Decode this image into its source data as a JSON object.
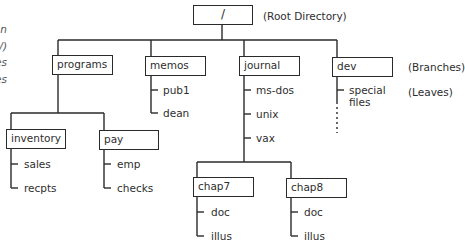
{
  "diagram": {
    "left_caption_fragments": [
      "n",
      "/)",
      "es",
      "es"
    ],
    "annotations": {
      "root": "(Root Directory)",
      "branches": "(Branches)",
      "leaves": "(Leaves)"
    },
    "root": {
      "label": "/"
    },
    "branches": [
      {
        "label": "programs",
        "children": [
          {
            "label": "inventory",
            "leaves": [
              "sales",
              "recpts"
            ]
          },
          {
            "label": "pay",
            "leaves": [
              "emp",
              "checks"
            ]
          }
        ]
      },
      {
        "label": "memos",
        "leaves": [
          "pub1",
          "dean"
        ]
      },
      {
        "label": "journal",
        "leaves": [
          "ms-dos",
          "unix",
          "vax"
        ],
        "children": [
          {
            "label": "chap7",
            "leaves": [
              "doc",
              "illus"
            ]
          },
          {
            "label": "chap8",
            "leaves": [
              "doc",
              "illus"
            ]
          }
        ]
      },
      {
        "label": "dev",
        "leaves": [
          "special",
          "files"
        ]
      }
    ]
  }
}
